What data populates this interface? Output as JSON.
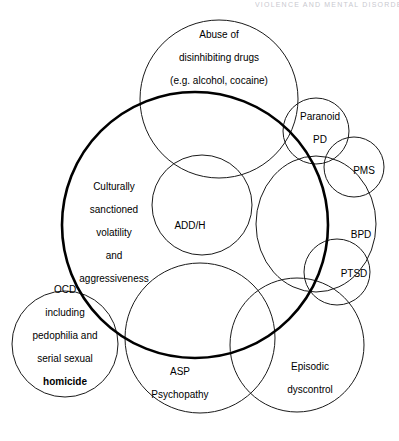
{
  "page": {
    "width": 399,
    "height": 441,
    "background": "#ffffff",
    "stroke_color": "#1a1a1a",
    "thick_stroke_color": "#000000",
    "running_head": "VIOLENCE AND MENTAL DISORDER"
  },
  "diagram": {
    "type": "venn",
    "title": "",
    "circles": [
      {
        "id": "culturally-sanctioned",
        "label": "Culturally\nsanctioned\nvolatility\nand\naggressiveness",
        "cx": 195,
        "cy": 225,
        "r": 133,
        "stroke_width": 2.6,
        "emphasis": "thick",
        "label_x": 114,
        "label_y": 232
      },
      {
        "id": "abuse-of-disinhibiting-drugs",
        "label": "Abuse of\ndisinhibiting drugs\n(e.g. alcohol, cocaine)",
        "cx": 219,
        "cy": 99,
        "r": 79,
        "stroke_width": 1,
        "emphasis": "normal",
        "label_x": 219,
        "label_y": 57
      },
      {
        "id": "add-h",
        "label": "ADD/H",
        "cx": 202,
        "cy": 205,
        "r": 50,
        "stroke_width": 1,
        "emphasis": "normal",
        "label_x": 190,
        "label_y": 225
      },
      {
        "id": "ocd",
        "label": "OCD\nincluding\npedophilia and\nserial sexual",
        "label_bold_tail": "homicide",
        "cx": 65,
        "cy": 344,
        "r": 53,
        "stroke_width": 1,
        "emphasis": "normal",
        "label_x": 65,
        "label_y": 335
      },
      {
        "id": "asp-psychopathy",
        "label": "ASP\nPsychopathy",
        "cx": 200,
        "cy": 338,
        "r": 75,
        "stroke_width": 1,
        "emphasis": "normal",
        "label_x": 180,
        "label_y": 383
      },
      {
        "id": "episodic-dyscontrol",
        "label": "Episodic\ndyscontrol",
        "cx": 297,
        "cy": 345,
        "r": 67,
        "stroke_width": 1,
        "emphasis": "normal",
        "label_x": 310,
        "label_y": 378
      },
      {
        "id": "paranoid-pd",
        "label": "Paranoid\nPD",
        "cx": 316,
        "cy": 131,
        "r": 33,
        "stroke_width": 1,
        "emphasis": "normal",
        "label_x": 320,
        "label_y": 128
      },
      {
        "id": "pms",
        "label": "PMS",
        "cx": 354,
        "cy": 167,
        "r": 30,
        "stroke_width": 1,
        "emphasis": "normal",
        "label_x": 363,
        "label_y": 170
      },
      {
        "id": "bpd",
        "label": "BPD",
        "cx": 312,
        "cy": 222,
        "r": 66,
        "stroke_width": 1,
        "emphasis": "normal",
        "label_x": 360,
        "label_y": 234
      },
      {
        "id": "ptsd",
        "label": "PTSD",
        "cx": 337,
        "cy": 272,
        "r": 33,
        "stroke_width": 1,
        "emphasis": "normal",
        "label_x": 353,
        "label_y": 273
      }
    ]
  },
  "labels": {
    "abuse": {
      "line1": "Abuse of",
      "line2": "disinhibiting drugs",
      "line3": "(e.g. alcohol, cocaine)"
    },
    "paranoid_pd": {
      "line1": "Paranoid",
      "line2": "PD"
    },
    "pms": {
      "line1": "PMS"
    },
    "bpd": {
      "line1": "BPD"
    },
    "ptsd": {
      "line1": "PTSD"
    },
    "culturally": {
      "line1": "Culturally",
      "line2": "sanctioned",
      "line3": "volatility",
      "line4": "and",
      "line5": "aggressiveness"
    },
    "addh": {
      "line1": "ADD/H"
    },
    "ocd": {
      "line1": "OCD",
      "line2": "including",
      "line3": "pedophilia and",
      "line4": "serial sexual",
      "line5": "homicide"
    },
    "asp": {
      "line1": "ASP",
      "line2": "Psychopathy"
    },
    "episodic": {
      "line1": "Episodic",
      "line2": "dyscontrol"
    }
  }
}
